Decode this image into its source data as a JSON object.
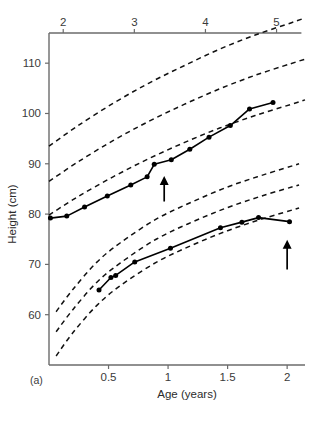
{
  "figure": {
    "panel_label": "(a)",
    "background_color": "#ffffff",
    "line_color": "#000000",
    "axis_color": "#6b6b6b"
  },
  "chart_data": {
    "type": "line",
    "title": "",
    "xlabel": "Age (years)",
    "ylabel": "Height (cm)",
    "grid": false,
    "legend": "none",
    "bottom_axis": {
      "label": "Age (years)",
      "ticks": [
        0.5,
        1,
        1.5,
        2
      ],
      "tick_labels": [
        "0.5",
        "1",
        "1.5",
        "2"
      ],
      "range": [
        0,
        2.15
      ]
    },
    "top_axis": {
      "label": "",
      "ticks": [
        2,
        3,
        4,
        5
      ],
      "tick_labels": [
        "2",
        "3",
        "4",
        "5"
      ],
      "range": [
        1.8,
        5.4
      ]
    },
    "left_axis": {
      "label": "Height (cm)",
      "ticks": [
        60,
        70,
        80,
        90,
        100,
        110
      ],
      "tick_labels": [
        "60",
        "70",
        "80",
        "90",
        "100",
        "110"
      ],
      "range": [
        50,
        116
      ]
    },
    "series": [
      {
        "name": "upper-child-growth",
        "axis": "top",
        "style": "solid-with-markers",
        "x": [
          1.82,
          2.05,
          2.3,
          2.62,
          2.95,
          3.18,
          3.28,
          3.52,
          3.78,
          4.05,
          4.35,
          4.62,
          4.95
        ],
        "y": [
          79.2,
          79.6,
          81.4,
          83.6,
          85.8,
          87.4,
          89.9,
          90.8,
          92.9,
          95.3,
          97.6,
          100.9,
          102.2
        ]
      },
      {
        "name": "lower-child-growth",
        "axis": "bottom",
        "style": "solid-with-markers",
        "x": [
          0.42,
          0.52,
          0.56,
          0.72,
          1.02,
          1.44,
          1.62,
          1.76,
          2.02
        ],
        "y": [
          64.9,
          67.4,
          67.8,
          70.5,
          73.2,
          77.3,
          78.4,
          79.3,
          78.5
        ]
      }
    ],
    "reference_curves": [
      {
        "name": "upper-centile-high",
        "axis": "top",
        "style": "dashed",
        "x": [
          1.8,
          2.2,
          2.7,
          3.2,
          3.7,
          4.2,
          4.7,
          5.2,
          5.4
        ],
        "y": [
          93.5,
          97.5,
          102.0,
          106.0,
          109.5,
          112.8,
          115.6,
          118.0,
          119.0
        ]
      },
      {
        "name": "upper-centile-mid",
        "axis": "top",
        "style": "dashed",
        "x": [
          1.8,
          2.2,
          2.7,
          3.2,
          3.7,
          4.2,
          4.7,
          5.2,
          5.4
        ],
        "y": [
          86.5,
          90.3,
          94.6,
          98.4,
          101.8,
          104.9,
          107.6,
          109.9,
          110.8
        ]
      },
      {
        "name": "upper-centile-low",
        "axis": "top",
        "style": "dashed",
        "x": [
          1.8,
          2.2,
          2.7,
          3.2,
          3.7,
          4.2,
          4.7,
          5.2,
          5.4
        ],
        "y": [
          79.8,
          83.4,
          87.4,
          91.0,
          94.2,
          97.1,
          99.6,
          101.8,
          102.7
        ]
      },
      {
        "name": "lower-centile-high",
        "axis": "bottom",
        "style": "dashed",
        "x": [
          0.06,
          0.2,
          0.4,
          0.6,
          0.9,
          1.2,
          1.5,
          1.8,
          2.1
        ],
        "y": [
          60.6,
          65.0,
          70.4,
          74.3,
          79.0,
          82.4,
          85.4,
          87.8,
          90.0
        ]
      },
      {
        "name": "lower-centile-mid",
        "axis": "bottom",
        "style": "dashed",
        "x": [
          0.06,
          0.2,
          0.4,
          0.6,
          0.9,
          1.2,
          1.5,
          1.8,
          2.1
        ],
        "y": [
          56.6,
          61.0,
          66.4,
          70.3,
          75.0,
          78.4,
          81.3,
          83.7,
          85.8
        ]
      },
      {
        "name": "lower-centile-low",
        "axis": "bottom",
        "style": "dashed",
        "x": [
          0.06,
          0.2,
          0.4,
          0.6,
          0.9,
          1.2,
          1.5,
          1.8,
          2.1
        ],
        "y": [
          51.8,
          56.4,
          61.8,
          65.8,
          70.4,
          73.8,
          76.7,
          79.1,
          81.2
        ]
      }
    ],
    "annotations": [
      {
        "name": "arrow-upper",
        "symbol": "up-arrow",
        "axis": "top",
        "x": 3.42,
        "y_tail": 82.5,
        "y_head": 87.2
      },
      {
        "name": "arrow-lower",
        "symbol": "up-arrow",
        "axis": "bottom",
        "x": 2.0,
        "y_tail": 69.0,
        "y_head": 74.5
      }
    ]
  }
}
